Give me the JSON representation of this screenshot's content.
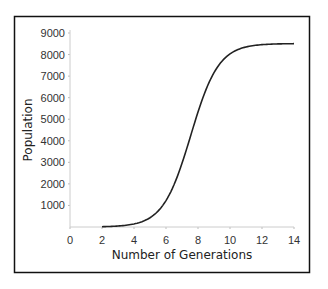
{
  "chart_data": {
    "type": "line",
    "title": "",
    "xlabel": "Number of Generations",
    "ylabel": "Population",
    "xlim": [
      0,
      14
    ],
    "ylim": [
      0,
      9000
    ],
    "x_ticks": [
      0,
      2,
      4,
      6,
      8,
      10,
      12,
      14
    ],
    "y_ticks": [
      1000,
      2000,
      3000,
      4000,
      5000,
      6000,
      7000,
      8000,
      9000
    ],
    "grid": false,
    "legend": null,
    "series": [
      {
        "name": "Population",
        "x": [
          2,
          3,
          4,
          5,
          6,
          6.5,
          7,
          7.5,
          8,
          8.5,
          9,
          10,
          11,
          12,
          13,
          14
        ],
        "y": [
          20,
          40,
          120,
          400,
          1300,
          2200,
          3300,
          4500,
          5800,
          6900,
          7600,
          8250,
          8450,
          8500,
          8510,
          8510
        ]
      }
    ],
    "colors": {
      "line": "#222222",
      "frame": "#111111",
      "axis": "#bbbbbb"
    }
  }
}
